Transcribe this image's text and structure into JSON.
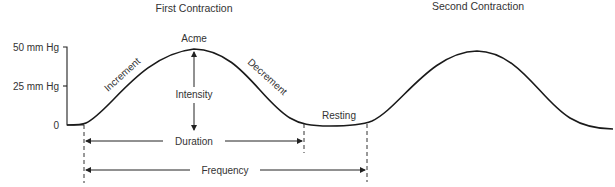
{
  "titles": {
    "first": "First Contraction",
    "second": "Second Contraction"
  },
  "axis": {
    "ticks": [
      {
        "label": "50 mm Hg",
        "value": 50
      },
      {
        "label": "25 mm Hg",
        "value": 25
      },
      {
        "label": "0",
        "value": 0
      }
    ]
  },
  "labels": {
    "acme": "Acme",
    "increment": "Increment",
    "decrement": "Decrement",
    "intensity": "Intensity",
    "resting": "Resting",
    "duration": "Duration",
    "frequency": "Frequency"
  },
  "colors": {
    "line": "#1a1a1a",
    "text": "#333333",
    "background": "#ffffff"
  }
}
